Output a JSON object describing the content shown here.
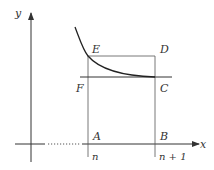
{
  "diagram": {
    "type": "integral-comparison",
    "axes": {
      "x_label": "x",
      "y_label": "y"
    },
    "points": {
      "A": "A",
      "B": "B",
      "C": "C",
      "D": "D",
      "E": "E",
      "F": "F"
    },
    "ticks": {
      "n": "n",
      "n_plus_1": "n + 1"
    },
    "colors": {
      "axis": "#333333",
      "curve": "#222222",
      "lines": "#555555"
    }
  }
}
